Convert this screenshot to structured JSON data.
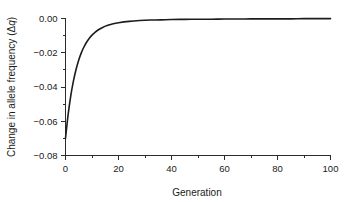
{
  "chart_data": {
    "type": "line",
    "title": "",
    "xlabel": "Generation",
    "ylabel": "Change in allele frequency (Δq)",
    "ylabel_prefix": "Change in allele frequency (Δ",
    "ylabel_italic": "q",
    "ylabel_suffix": ")",
    "xlim": [
      0,
      100
    ],
    "ylim": [
      -0.08,
      0.0
    ],
    "grid": false,
    "legend": null,
    "line_color": "#1c1c1c",
    "background_color": "#ffffff",
    "axis_color": "#2b2b2b",
    "xticks": [
      0,
      20,
      40,
      60,
      80,
      100
    ],
    "xtick_labels": [
      "0",
      "20",
      "40",
      "60",
      "80",
      "100"
    ],
    "xticks_minor": [
      10,
      30,
      50,
      70,
      90
    ],
    "yticks": [
      0.0,
      -0.02,
      -0.04,
      -0.06,
      -0.08
    ],
    "ytick_labels": [
      "0.00",
      "−0.02",
      "−0.04",
      "−0.06",
      "−0.08"
    ],
    "yticks_minor": [
      -0.01,
      -0.03,
      -0.05,
      -0.07
    ],
    "series": [
      {
        "name": "delta-q",
        "x": [
          0,
          1,
          2,
          3,
          4,
          5,
          6,
          7,
          8,
          9,
          10,
          12,
          14,
          16,
          18,
          20,
          24,
          28,
          32,
          36,
          40,
          45,
          50,
          55,
          60,
          65,
          70,
          75,
          80,
          85,
          90,
          95,
          100
        ],
        "y": [
          -0.07,
          -0.056,
          -0.045,
          -0.0364,
          -0.0296,
          -0.0242,
          -0.0199,
          -0.0165,
          -0.0137,
          -0.0115,
          -0.0097,
          -0.007,
          -0.0052,
          -0.004,
          -0.0031,
          -0.0025,
          -0.0017,
          -0.0012,
          -0.0009,
          -0.0008,
          -0.0006,
          -0.0005,
          -0.0004,
          -0.0004,
          -0.0003,
          -0.0003,
          -0.0002,
          -0.0002,
          -0.0002,
          -0.0002,
          -0.0001,
          -0.0001,
          -0.0001
        ]
      }
    ]
  }
}
